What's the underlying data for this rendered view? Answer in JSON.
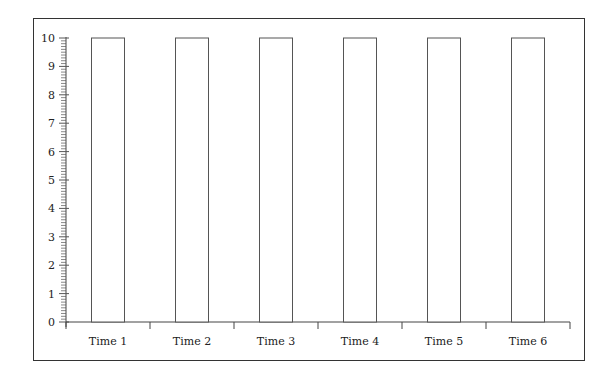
{
  "chart_data": {
    "type": "bar",
    "title": "",
    "xlabel": "",
    "ylabel": "",
    "categories": [
      "Time 1",
      "Time 2",
      "Time 3",
      "Time 4",
      "Time 5",
      "Time 6"
    ],
    "values": [
      10,
      10,
      10,
      10,
      10,
      10
    ],
    "ylim": [
      0,
      10
    ],
    "yticks": [
      0,
      1,
      2,
      3,
      4,
      5,
      6,
      7,
      8,
      9,
      10
    ],
    "minor_ticks_per_unit": 10,
    "grid": false,
    "legend": null,
    "bar_fill": "#ffffff",
    "bar_stroke": "#555555"
  }
}
